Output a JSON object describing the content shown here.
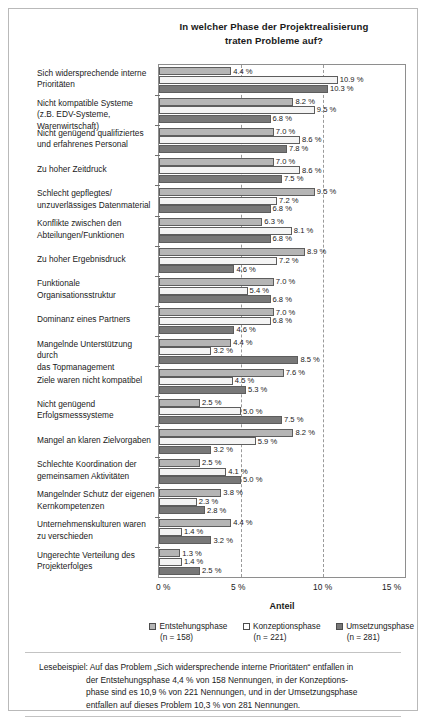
{
  "title": {
    "line1": "In welcher Phase der Projektrealisierung",
    "line2": "traten Probleme auf?"
  },
  "axis": {
    "xlabel": "Anteil",
    "ticks": [
      "0 %",
      "5 %",
      "10 %",
      "15 %"
    ]
  },
  "legend": {
    "items": [
      {
        "label": "Entstehungsphase",
        "n": "(n = 158)",
        "color": "#b5b5b5"
      },
      {
        "label": "Konzeptionsphase",
        "n": "(n = 221)",
        "color": "#ffffff"
      },
      {
        "label": "Umsetzungsphase",
        "n": "(n = 281)",
        "color": "#787878"
      }
    ]
  },
  "footer": {
    "line1": "Lesebeispiel: Auf das Problem „Sich widersprechende interne Prioritäten“ entfallen in",
    "line2": "der Entstehungsphase 4,4 % von 158 Nennungen, in der Konzeptions-",
    "line3": "phase sind es 10,9 % von 221 Nennungen, und in der Umsetzungsphase",
    "line4": "entfallen auf dieses Problem 10,3 % von 281 Nennungen."
  },
  "chart_data": {
    "type": "bar",
    "orientation": "horizontal",
    "title": "In welcher Phase der Projektrealisierung traten Probleme auf?",
    "xlabel": "Anteil",
    "ylabel": "",
    "xlim": [
      0,
      15
    ],
    "xticks": [
      0,
      5,
      10,
      15
    ],
    "xtick_labels": [
      "0 %",
      "5 %",
      "10 %",
      "15 %"
    ],
    "grid": "vertical-dashed",
    "legend_position": "bottom",
    "categories": [
      "Sich widersprechende interne Prioritäten",
      "Nicht kompatible Systeme (z.B. EDV-Systeme, Warenwirtschaft)",
      "Nicht genügend qualifiziertes und erfahrenes Personal",
      "Zu hoher Zeitdruck",
      "Schlecht gepflegtes/ unzuverlässiges Datenmaterial",
      "Konflikte zwischen den Abteilungen/Funktionen",
      "Zu hoher Ergebnisdruck",
      "Funktionale Organisationsstruktur",
      "Dominanz eines Partners",
      "Mangelnde Unterstützung durch das Topmanagement",
      "Ziele waren nicht kompatibel",
      "Nicht genügend Erfolgsmesssysteme",
      "Mangel an klaren Zielvorgaben",
      "Schlechte Koordination der gemeinsamen Aktivitäten",
      "Mangelnder Schutz der eigenen Kernkompetenzen",
      "Unternehmenskulturen waren zu verschieden",
      "Ungerechte Verteilung des Projekterfolges"
    ],
    "category_lines": [
      [
        "Sich widersprechende interne",
        "Prioritäten"
      ],
      [
        "Nicht kompatible Systeme",
        "(z.B. EDV-Systeme, Warenwirtschaft)"
      ],
      [
        "Nicht genügend qualifiziertes",
        "und erfahrenes Personal"
      ],
      [
        "Zu hoher Zeitdruck"
      ],
      [
        "Schlecht gepflegtes/",
        "unzuverlässiges Datenmaterial"
      ],
      [
        "Konflikte zwischen den",
        "Abteilungen/Funktionen"
      ],
      [
        "Zu hoher Ergebnisdruck"
      ],
      [
        "Funktionale",
        "Organisationsstruktur"
      ],
      [
        "Dominanz eines Partners"
      ],
      [
        "Mangelnde Unterstützung durch",
        "das Topmanagement"
      ],
      [
        "Ziele waren nicht kompatibel"
      ],
      [
        "Nicht genügend",
        "Erfolgsmesssysteme"
      ],
      [
        "Mangel an klaren Zielvorgaben"
      ],
      [
        "Schlechte Koordination der",
        "gemeinsamen Aktivitäten"
      ],
      [
        "Mangelnder Schutz der eigenen",
        "Kernkompetenzen"
      ],
      [
        "Unternehmenskulturen waren",
        "zu verschieden"
      ],
      [
        "Ungerechte Verteilung des",
        "Projekterfolges"
      ]
    ],
    "series": [
      {
        "name": "Entstehungsphase",
        "n": 158,
        "color": "#b5b5b5",
        "values": [
          4.4,
          8.2,
          7.0,
          7.0,
          9.5,
          6.3,
          8.9,
          7.0,
          7.0,
          4.4,
          7.6,
          2.5,
          8.2,
          2.5,
          3.8,
          4.4,
          1.3
        ],
        "value_labels": [
          "4.4 %",
          "8.2 %",
          "7.0 %",
          "7.0 %",
          "9.5 %",
          "6.3 %",
          "8.9 %",
          "7.0 %",
          "7.0 %",
          "4.4 %",
          "7.6 %",
          "2.5 %",
          "8.2 %",
          "2.5 %",
          "3.8 %",
          "4.4 %",
          "1.3 %"
        ]
      },
      {
        "name": "Konzeptionsphase",
        "n": 221,
        "color": "#f4f4f4",
        "values": [
          10.9,
          9.5,
          8.6,
          8.6,
          7.2,
          8.1,
          7.2,
          5.4,
          6.8,
          3.2,
          4.5,
          5.0,
          5.9,
          4.1,
          2.3,
          1.4,
          1.4
        ],
        "value_labels": [
          "10.9 %",
          "9.5 %",
          "8.6 %",
          "8.6 %",
          "7.2 %",
          "8.1 %",
          "7.2 %",
          "5.4 %",
          "6.8 %",
          "3.2 %",
          "4.5 %",
          "5.0 %",
          "5.9 %",
          "4.1 %",
          "2.3 %",
          "1.4 %",
          "1.4 %"
        ]
      },
      {
        "name": "Umsetzungsphase",
        "n": 281,
        "color": "#787878",
        "values": [
          10.3,
          6.8,
          7.8,
          7.5,
          6.8,
          6.8,
          4.6,
          6.8,
          4.6,
          8.5,
          5.3,
          7.5,
          3.2,
          5.0,
          2.8,
          3.2,
          2.5
        ],
        "value_labels": [
          "10.3 %",
          "6.8 %",
          "7.8 %",
          "7.5 %",
          "6.8 %",
          "6.8 %",
          "4.6 %",
          "6.8 %",
          "4.6 %",
          "8.5 %",
          "5.3 %",
          "7.5 %",
          "3.2 %",
          "5.0 %",
          "2.8 %",
          "3.2 %",
          "2.5 %"
        ]
      }
    ]
  }
}
